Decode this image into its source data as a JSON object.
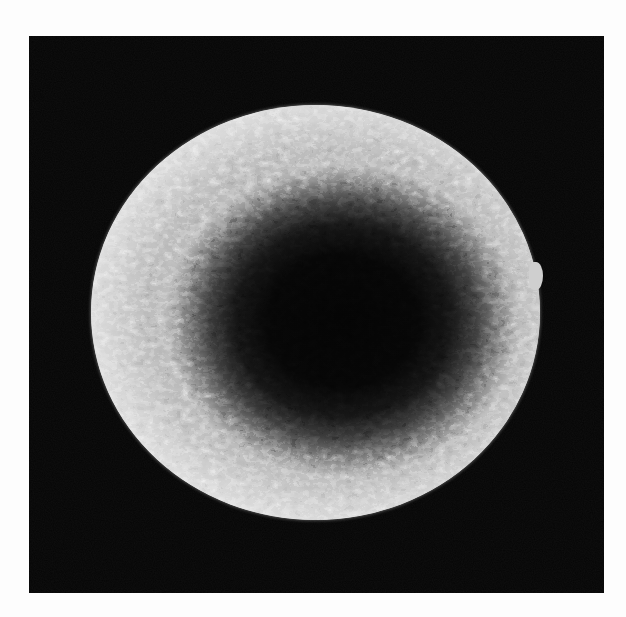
{
  "image": {
    "kind": "scanning electron micrograph",
    "subject": "spherical particle with granular textured surface",
    "description": "Bright smooth rim with a dark, rough, speckled central region on a black background",
    "colors": {
      "page_background": "#ffffff",
      "panel_background": "#050505",
      "sphere_rim": "#d8d8d8",
      "sphere_center": "#050505"
    }
  }
}
